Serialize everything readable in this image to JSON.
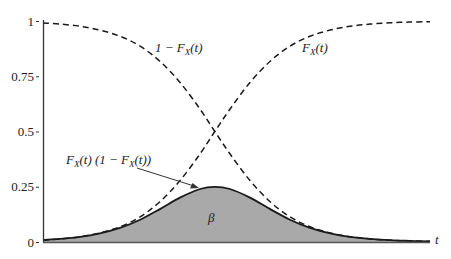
{
  "chart_data": {
    "type": "line",
    "title": "",
    "xlabel": "t",
    "ylabel": "",
    "xlim": [
      0,
      1
    ],
    "ylim": [
      0,
      1
    ],
    "grid": false,
    "legend": "none",
    "yticks": [
      {
        "value": 1,
        "label": "1"
      },
      {
        "value": 0.75,
        "label": "0.75"
      },
      {
        "value": 0.5,
        "label": "0.5"
      },
      {
        "value": 0.25,
        "label": "0.25"
      },
      {
        "value": 0,
        "label": "0"
      }
    ],
    "x": [
      0,
      0.044,
      0.096,
      0.147,
      0.199,
      0.251,
      0.302,
      0.354,
      0.406,
      0.444,
      0.483,
      0.535,
      0.587,
      0.638,
      0.69,
      0.742,
      0.793,
      0.845,
      0.897,
      0.948,
      1.0
    ],
    "series": [
      {
        "name": "F_X(t)",
        "style": "dashed",
        "values": [
          0.009,
          0.014,
          0.024,
          0.041,
          0.069,
          0.114,
          0.182,
          0.278,
          0.399,
          0.5,
          0.601,
          0.722,
          0.818,
          0.886,
          0.931,
          0.959,
          0.976,
          0.986,
          0.992,
          0.995,
          0.997
        ]
      },
      {
        "name": "1 - F_X(t)",
        "style": "dashed",
        "values": [
          0.991,
          0.986,
          0.976,
          0.959,
          0.931,
          0.886,
          0.818,
          0.722,
          0.601,
          0.5,
          0.399,
          0.278,
          0.182,
          0.114,
          0.069,
          0.041,
          0.024,
          0.014,
          0.008,
          0.005,
          0.003
        ]
      },
      {
        "name": "F_X(t) (1 - F_X(t))",
        "style": "solid, filled gray",
        "values": [
          0.009,
          0.014,
          0.023,
          0.039,
          0.064,
          0.101,
          0.149,
          0.201,
          0.24,
          0.25,
          0.24,
          0.201,
          0.149,
          0.101,
          0.064,
          0.039,
          0.023,
          0.014,
          0.008,
          0.005,
          0.003
        ]
      }
    ],
    "annotations": [
      {
        "text_main": "1 − F",
        "sub": "X",
        "tail": "(t)",
        "target": "1 - F_X(t) curve"
      },
      {
        "text_main": "F",
        "sub": "X",
        "tail": "(t)",
        "target": "F_X(t) curve"
      },
      {
        "text_main": "F",
        "sub": "X",
        "mid": "(t) (1 − F",
        "sub2": "X",
        "tail": "(t))",
        "target": "product curve (arrow)"
      },
      {
        "text": "β",
        "target": "shaded area under product curve"
      }
    ]
  },
  "colors": {
    "axis": "#333333",
    "curve": "#1a1a1a",
    "fill": "#a9a9a9"
  },
  "labels": {
    "x_axis": "t",
    "one_minus_F_main": "1 − F",
    "one_minus_F_sub": "X",
    "one_minus_F_tail": "(t)",
    "F_main": "F",
    "F_sub": "X",
    "F_tail": "(t)",
    "prod_main": "F",
    "prod_sub": "X",
    "prod_mid": "(t) (1 − F",
    "prod_sub2": "X",
    "prod_tail": "(t))",
    "beta": "β"
  }
}
